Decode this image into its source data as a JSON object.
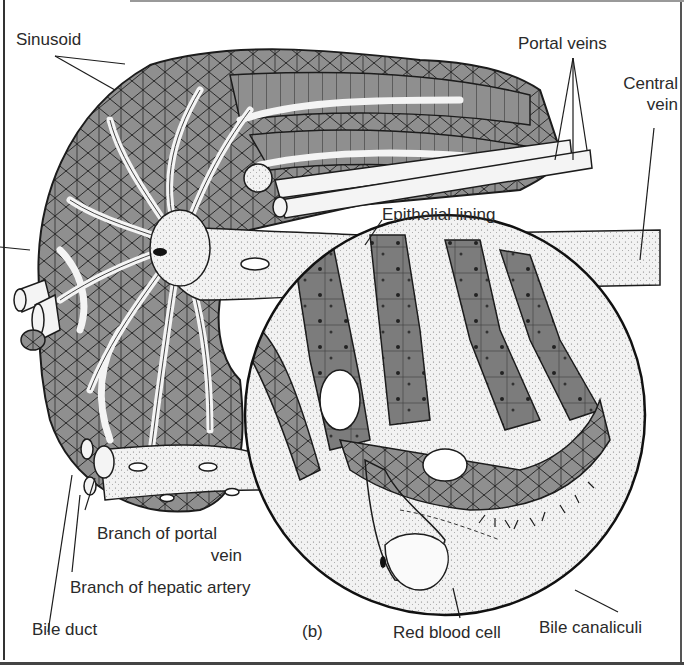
{
  "figure": {
    "panel_label": "(b)",
    "colors": {
      "tissue_gray": "#8f8f8f",
      "tissue_dark": "#6e6e6e",
      "vessel_white": "#f4f4f4",
      "line": "#1c1c1c",
      "label_text": "#2a2a2a"
    }
  },
  "labels": {
    "sinusoid": "Sinusoid",
    "portal_veins": "Portal veins",
    "central_vein_line1": "Central",
    "central_vein_line2": "vein",
    "epithelial_lining": "Epithelial lining",
    "branch_portal_vein_line1": "Branch of portal",
    "branch_portal_vein_line2": "vein",
    "branch_hepatic_artery": "Branch of hepatic artery",
    "bile_duct": "Bile duct",
    "panel": "(b)",
    "red_blood_cell": "Red blood cell",
    "bile_canaliculi": "Bile canaliculi"
  }
}
